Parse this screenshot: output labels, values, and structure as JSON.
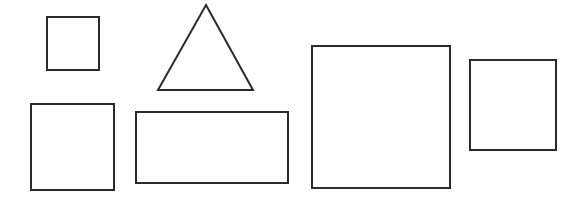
{
  "canvas": {
    "width": 580,
    "height": 202,
    "background_color": "#ffffff",
    "stroke_color": "#2b2b2b",
    "stroke_width": 2
  },
  "figure": {
    "shape_count": 6
  },
  "shapes": [
    {
      "id": "shape-1",
      "kind": "square",
      "label": "small-square-top-left",
      "x": 47,
      "y": 17,
      "width": 52,
      "height": 53,
      "points": "47,17 99,17 99,70 47,70"
    },
    {
      "id": "shape-2",
      "kind": "triangle",
      "label": "triangle-top-center",
      "x": 158,
      "y": 5,
      "width": 95,
      "height": 85,
      "points": "206,5 253,90 158,90"
    },
    {
      "id": "shape-3",
      "kind": "square",
      "label": "square-bottom-left",
      "x": 31,
      "y": 104,
      "width": 83,
      "height": 86,
      "points": "31,104 114,104 114,190 31,190"
    },
    {
      "id": "shape-4",
      "kind": "rectangle",
      "label": "wide-rectangle-bottom-center",
      "x": 136,
      "y": 112,
      "width": 152,
      "height": 71,
      "points": "136,112 288,112 288,183 136,183"
    },
    {
      "id": "shape-5",
      "kind": "square",
      "label": "large-square-center-right",
      "x": 312,
      "y": 46,
      "width": 138,
      "height": 142,
      "points": "312,46 450,46 450,188 312,188"
    },
    {
      "id": "shape-6",
      "kind": "square",
      "label": "square-far-right",
      "x": 470,
      "y": 60,
      "width": 86,
      "height": 90,
      "points": "470,60 556,60 556,150 470,150"
    }
  ]
}
